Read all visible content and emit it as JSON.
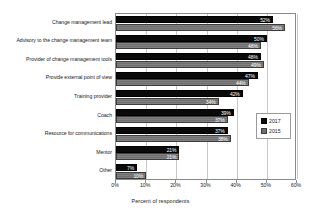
{
  "chart_data": {
    "type": "bar",
    "orientation": "horizontal",
    "title": "",
    "xlabel": "Percent of respondents",
    "ylabel": "",
    "xlim": [
      0,
      60
    ],
    "xticks": [
      "0%",
      "10%",
      "20%",
      "30%",
      "40%",
      "50%",
      "60%"
    ],
    "xtick_values": [
      0,
      10,
      20,
      30,
      40,
      50,
      60
    ],
    "grid": true,
    "legend_position": "center-right",
    "categories": [
      "Change management lead",
      "Advisory to the change management team",
      "Provider of change management tools",
      "Provide external point of view",
      "Training provider",
      "Coach",
      "Resource for communications",
      "Mentor",
      "Other"
    ],
    "series": [
      {
        "name": "2017",
        "color": "#0a0a0a",
        "values": [
          52,
          50,
          48,
          47,
          42,
          39,
          37,
          21,
          7
        ],
        "labels": [
          "52%",
          "50%",
          "48%",
          "47%",
          "42%",
          "39%",
          "37%",
          "21%",
          "7%"
        ]
      },
      {
        "name": "2015",
        "color": "#6e6e6e",
        "values": [
          56,
          48,
          49,
          44,
          34,
          37,
          38,
          21,
          10
        ],
        "labels": [
          "56%",
          "48%",
          "49%",
          "44%",
          "34%",
          "37%",
          "38%",
          "21%",
          "10%"
        ]
      }
    ]
  }
}
